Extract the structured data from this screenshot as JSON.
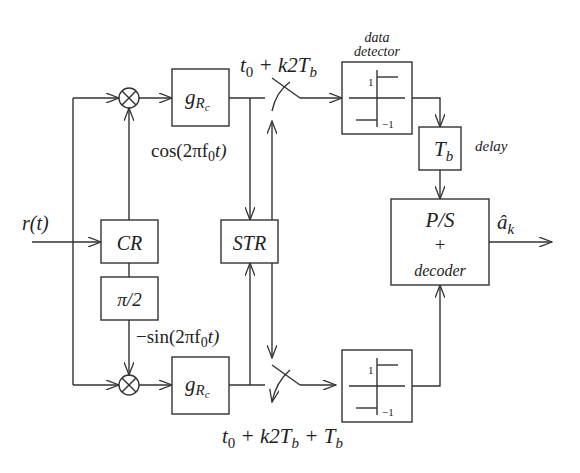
{
  "diagram": {
    "input_label": "r(t)",
    "output_label": "â",
    "output_sub": "k",
    "blocks": {
      "filter_top": {
        "main": "g",
        "sub": "R",
        "subsub": "c"
      },
      "filter_bottom": {
        "main": "g",
        "sub": "R",
        "subsub": "c"
      },
      "carrier_recovery": "CR",
      "phase_shift": "π/2",
      "symbol_timing": "STR",
      "delay": {
        "main": "T",
        "sub": "b"
      },
      "delay_label": "delay",
      "ps_decoder": {
        "line1": "P/S",
        "line2": "+",
        "line3": "decoder"
      },
      "detector_title_1": "data",
      "detector_title_2": "detector",
      "detector_level_pos": "1",
      "detector_level_neg": "−1"
    },
    "signals": {
      "cos_label": "cos(2πf",
      "cos_sub": "0",
      "cos_tail": "t)",
      "sin_label": "−sin(2πf",
      "sin_sub": "0",
      "sin_tail": "t)"
    },
    "sampling": {
      "top": {
        "a": "t",
        "a_sub": "0",
        "rest": " + k2T",
        "rest_sub": "b"
      },
      "bottom": {
        "a": "t",
        "a_sub": "0",
        "rest": " + k2T",
        "rest_sub": "b",
        "tail": " + T",
        "tail_sub": "b"
      }
    },
    "multiplier_symbol": "⊗"
  }
}
